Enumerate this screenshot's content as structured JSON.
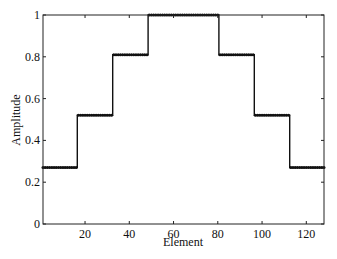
{
  "chart_data": {
    "type": "line",
    "title": "",
    "xlabel": "Element",
    "ylabel": "Amplitude",
    "xlim": [
      1,
      128
    ],
    "ylim": [
      0,
      1
    ],
    "xticks": [
      20,
      40,
      60,
      80,
      100,
      120
    ],
    "yticks": [
      0,
      0.2,
      0.4,
      0.6,
      0.8,
      1
    ],
    "ytick_labels": [
      "0",
      "0.2",
      "0.4",
      "0.6",
      "0.8",
      "1"
    ],
    "grid": false,
    "legend": null,
    "series": [
      {
        "name": "Amplitude",
        "color": "#111111",
        "steps": [
          {
            "x_start": 1,
            "x_end": 16,
            "value": 0.27
          },
          {
            "x_start": 17,
            "x_end": 32,
            "value": 0.52
          },
          {
            "x_start": 33,
            "x_end": 48,
            "value": 0.81
          },
          {
            "x_start": 49,
            "x_end": 80,
            "value": 1.0
          },
          {
            "x_start": 81,
            "x_end": 96,
            "value": 0.81
          },
          {
            "x_start": 97,
            "x_end": 112,
            "value": 0.52
          },
          {
            "x_start": 113,
            "x_end": 128,
            "value": 0.27
          }
        ]
      }
    ]
  }
}
